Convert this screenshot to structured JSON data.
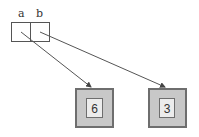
{
  "diagram": {
    "variables": [
      {
        "name": "a",
        "points_to": "6"
      },
      {
        "name": "b",
        "points_to": "3"
      }
    ],
    "objects": [
      {
        "value": "6"
      },
      {
        "value": "3"
      }
    ],
    "colors": {
      "outer_fill": "#c8c8c8",
      "outer_stroke": "#6e6e6e",
      "inner_fill": "#ececec",
      "cell_stroke": "#555555",
      "arrow": "#555555"
    }
  }
}
